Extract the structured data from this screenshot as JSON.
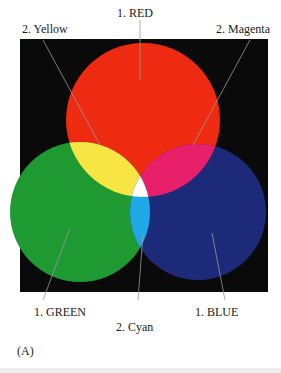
{
  "figure": {
    "panel_label": "(A)",
    "labels": {
      "red": "1. RED",
      "yellow": "2. Yellow",
      "magenta": "2. Magenta",
      "green": "1. GREEN",
      "cyan": "2. Cyan",
      "blue": "1. BLUE"
    },
    "colors": {
      "background": "#0a0a0a",
      "red": "#ee2a10",
      "green": "#1f9a32",
      "blue": "#1d2a7a",
      "yellow": "#f7e544",
      "magenta": "#e8206a",
      "cyan": "#1ea8e6",
      "white": "#ffffff"
    }
  }
}
